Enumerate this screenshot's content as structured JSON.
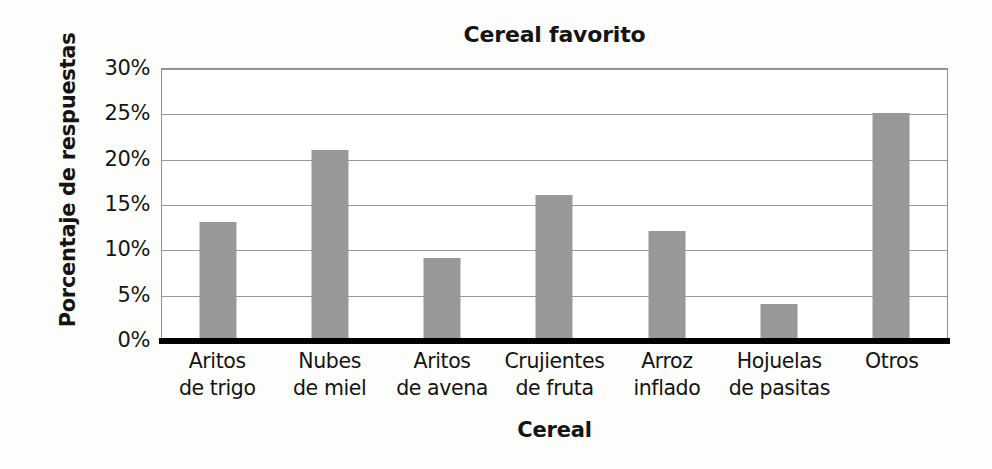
{
  "chart_data": {
    "type": "bar",
    "title": "Cereal favorito",
    "xlabel": "Cereal",
    "ylabel": "Porcentaje de respuestas",
    "categories": [
      "Aritos de trigo",
      "Nubes de miel",
      "Aritos de avena",
      "Crujientes de fruta",
      "Arroz inflado",
      "Hojuelas de pasitas",
      "Otros"
    ],
    "category_lines": [
      [
        "Aritos",
        "de trigo"
      ],
      [
        "Nubes",
        "de miel"
      ],
      [
        "Aritos",
        "de avena"
      ],
      [
        "Crujientes",
        "de fruta"
      ],
      [
        "Arroz",
        "inflado"
      ],
      [
        "Hojuelas",
        "de pasitas"
      ],
      [
        "Otros",
        ""
      ]
    ],
    "values": [
      13,
      21,
      9,
      16,
      12,
      4,
      25
    ],
    "value_labels": [
      "13%",
      "21%",
      "9%",
      "16%",
      "12%",
      "4%",
      "25%"
    ],
    "ylim": [
      0,
      30
    ],
    "ytick_values": [
      30,
      25,
      20,
      15,
      10,
      5,
      0
    ],
    "ytick_labels": [
      "30%",
      "25%",
      "20%",
      "15%",
      "10%",
      "5%",
      "0%"
    ],
    "grid": true,
    "legend": "none",
    "bar_color": "#989898",
    "gridline_color": "#9a9a9a",
    "axis_color": "#000000",
    "text_color": "#141414",
    "background": "#fdfdfb"
  }
}
